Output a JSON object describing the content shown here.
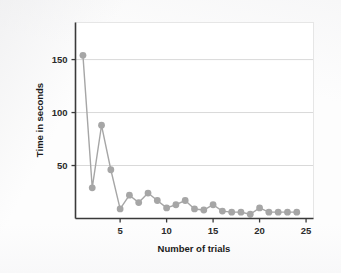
{
  "figure": {
    "background_color": "#fdfdfd",
    "plot_background_color": "#ffffff"
  },
  "chart_data": {
    "type": "line",
    "title": "",
    "subtitle": "",
    "xlabel": "Number of trials",
    "ylabel": "Time in seconds",
    "xlim": [
      0.2,
      25.8
    ],
    "ylim": [
      0,
      185
    ],
    "xticks": [
      5,
      10,
      15,
      20,
      25
    ],
    "xtick_labels": [
      "5",
      "10",
      "15",
      "20",
      "25"
    ],
    "yticks": [
      50,
      100,
      150
    ],
    "ytick_labels": [
      "50",
      "100",
      "150"
    ],
    "grid": "horizontal",
    "grid_color": "#d9d9d9",
    "legend": "none",
    "series_color": "#a6a6a6",
    "marker": "circle",
    "marker_size": 3.4,
    "line_width": 1.4,
    "x": [
      1,
      2,
      3,
      4,
      5,
      6,
      7,
      8,
      9,
      10,
      11,
      12,
      13,
      14,
      15,
      16,
      17,
      18,
      19,
      20,
      21,
      22,
      23,
      24
    ],
    "values": [
      154,
      29,
      88,
      46,
      9,
      22,
      15,
      24,
      17,
      10,
      13,
      17,
      9,
      8,
      13,
      7,
      6,
      6,
      4,
      10,
      6,
      6,
      6,
      6
    ],
    "series": [
      {
        "name": "time",
        "values": [
          154,
          29,
          88,
          46,
          9,
          22,
          15,
          24,
          17,
          10,
          13,
          17,
          9,
          8,
          13,
          7,
          6,
          6,
          4,
          10,
          6,
          6,
          6,
          6
        ]
      }
    ]
  },
  "axes": {
    "left_spine_color": "#3a3a3a",
    "bottom_spine_color": "#3a3a3a",
    "tick_color": "#3a3a3a"
  }
}
